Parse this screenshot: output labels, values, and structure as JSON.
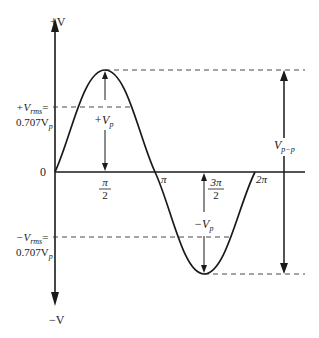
{
  "diagram": {
    "axes": {
      "y_top_label": "+V",
      "y_bottom_label": "−V",
      "origin_label": "0"
    },
    "x_ticks": [
      {
        "num": "π",
        "den": "2"
      },
      {
        "label": "π"
      },
      {
        "num": "3π",
        "den": "2"
      },
      {
        "label": "2π"
      }
    ],
    "labels": {
      "pos_rms_line1": "+V",
      "pos_rms_sub": "rms",
      "pos_rms_eq": "=",
      "pos_rms_line2": "0.707V",
      "pos_rms_line2_sub": "p",
      "neg_rms_line1": "−V",
      "neg_rms_sub": "rms",
      "neg_rms_eq": "=",
      "neg_rms_line2": "0.707V",
      "neg_rms_line2_sub": "p",
      "pos_peak": "+V",
      "pos_peak_sub": "p",
      "neg_peak": "−V",
      "neg_peak_sub": "p",
      "peak_to_peak": "V",
      "peak_to_peak_sub": "p−p"
    },
    "colors": {
      "line": "#1a1a1a",
      "dashed": "#333333"
    }
  }
}
